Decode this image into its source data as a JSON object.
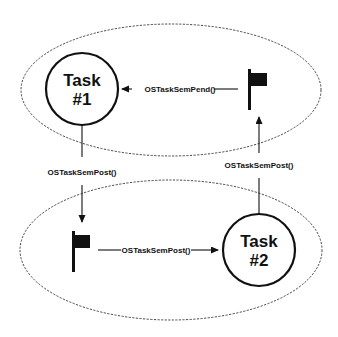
{
  "diagram": {
    "type": "task-semaphore-signaling",
    "regions": [
      {
        "id": "top-region",
        "shape": "dashed-ellipse"
      },
      {
        "id": "bottom-region",
        "shape": "dashed-ellipse"
      }
    ],
    "nodes": {
      "task1": {
        "line1": "Task",
        "line2": "#1"
      },
      "task2": {
        "line1": "Task",
        "line2": "#2"
      },
      "semaphore1": {
        "icon": "flag-icon"
      },
      "semaphore2": {
        "icon": "flag-icon"
      }
    },
    "edges": {
      "sem1_to_task1": {
        "label": "OSTaskSemPend()",
        "from": "semaphore1",
        "to": "task1"
      },
      "task1_to_sem2": {
        "label": "OSTaskSemPost()",
        "from": "task1",
        "to": "semaphore2"
      },
      "sem2_to_task2": {
        "label": "OSTaskSemPost()",
        "from": "semaphore2",
        "to": "task2"
      },
      "task2_to_sem1": {
        "label": "OSTaskSemPost()",
        "from": "task2",
        "to": "semaphore1"
      }
    },
    "colors": {
      "stroke": "#111111",
      "ellipse": "#333333",
      "background": "#ffffff"
    }
  }
}
